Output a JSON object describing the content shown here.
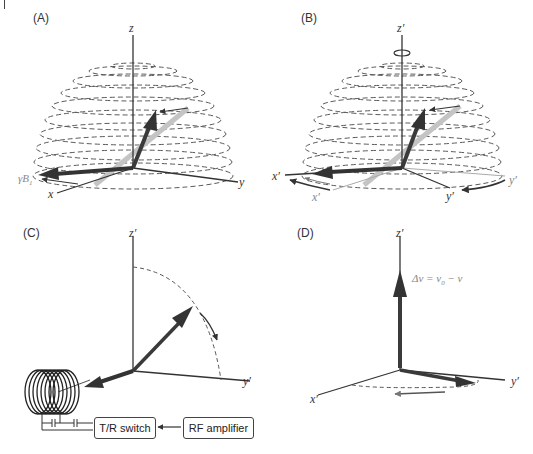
{
  "figure": {
    "panels": [
      {
        "id": "A",
        "label": "(A)",
        "axes": {
          "z": "z",
          "y": "y",
          "x": "x"
        },
        "field_label": "γB",
        "field_subscript": "1"
      },
      {
        "id": "B",
        "label": "(B)",
        "axes": {
          "z": "z′",
          "x": "x′",
          "y": "y′",
          "x_ghost": "x′",
          "y_ghost": "y′"
        }
      },
      {
        "id": "C",
        "label": "(C)",
        "axes": {
          "z": "z′",
          "y": "y′"
        },
        "blocks": {
          "switch": "T/R switch",
          "amplifier": "RF amplifier"
        }
      },
      {
        "id": "D",
        "label": "(D)",
        "axes": {
          "z": "z′",
          "x": "x′",
          "y": "y′"
        },
        "equation": {
          "lhs": "Δν = ν",
          "sub": "0",
          "rhs": " − ν"
        }
      }
    ],
    "colors": {
      "axis": "#333333",
      "vector_dark": "#3a3a3a",
      "vector_light": "#bdbdbd",
      "dashed": "#555555",
      "background": "#ffffff"
    }
  }
}
